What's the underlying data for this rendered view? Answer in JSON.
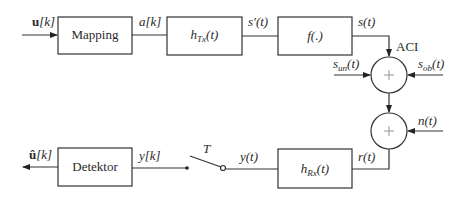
{
  "diagram": {
    "title": "",
    "blocks": {
      "mapping": {
        "label": "Mapping"
      },
      "htx": {
        "label_main": "h",
        "label_sub": "Tx",
        "label_arg": "(t)"
      },
      "f": {
        "label": "f(.)"
      },
      "hrx": {
        "label_main": "h",
        "label_sub": "Rx",
        "label_arg": "(t)"
      },
      "detektor": {
        "label": "Detektor"
      }
    },
    "summers": {
      "sum1": {
        "symbol": "+"
      },
      "sum2": {
        "symbol": "+"
      }
    },
    "signals": {
      "input": {
        "bold": "u",
        "rest": "[k]"
      },
      "a": "a[k]",
      "s_prime": "s′(t)",
      "s": "s(t)",
      "aci": "ACI",
      "s_un": {
        "main": "s",
        "sub": "un",
        "arg": "(t)"
      },
      "s_ob": {
        "main": "s",
        "sub": "ob",
        "arg": "(t)"
      },
      "n": "n(t)",
      "r": "r(t)",
      "y_t": "y(t)",
      "switch_label": "T",
      "y_k": "y[k]",
      "output": {
        "bold": "û",
        "rest": "[k]"
      }
    },
    "colors": {
      "stroke": "#333333",
      "text": "#2a2a2a",
      "background": "#ffffff"
    }
  }
}
